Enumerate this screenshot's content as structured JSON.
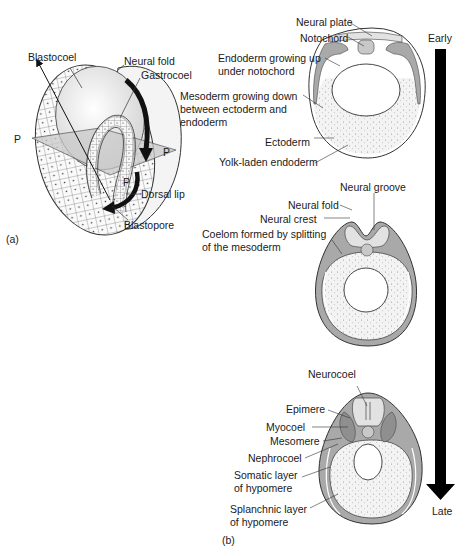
{
  "panel_a": {
    "tag": "(a)",
    "labels": {
      "blastocoel": "Blastocoel",
      "neural_fold": "Neural fold",
      "gastrocoel": "Gastrocoel",
      "p_left": "P",
      "p_right": "P",
      "p_bottom": "P",
      "dorsal_lip": "Dorsal lip",
      "blastopore": "Blastopore"
    }
  },
  "panel_b": {
    "tag": "(b)",
    "timeline": {
      "start": "Early",
      "end": "Late"
    },
    "stage1": {
      "neural_plate": "Neural plate",
      "notochord": "Notochord",
      "endoderm_up_1": "Endoderm growing up",
      "endoderm_up_2": "under notochord",
      "mesoderm_down_1": "Mesoderm growing down",
      "mesoderm_down_2": "between ectoderm and",
      "mesoderm_down_3": "endoderm",
      "ectoderm": "Ectoderm",
      "yolk": "Yolk-laden endoderm"
    },
    "stage2": {
      "neural_groove": "Neural groove",
      "neural_fold": "Neural fold",
      "neural_crest": "Neural crest",
      "coelom_1": "Coelom formed by splitting",
      "coelom_2": "of the mesoderm"
    },
    "stage3": {
      "neurocoel": "Neurocoel",
      "epimere": "Epimere",
      "myocoel": "Myocoel",
      "mesomere": "Mesomere",
      "nephrocoel": "Nephrocoel",
      "somatic_1": "Somatic layer",
      "somatic_2": "of hypomere",
      "splanchnic_1": "Splanchnic layer",
      "splanchnic_2": "of hypomere"
    }
  },
  "colors": {
    "mesoderm_gray": "#a9a9a9",
    "neural_light": "#e2e2e2",
    "yolk_fill": "#f1f1f1",
    "arrow": "#000000"
  }
}
